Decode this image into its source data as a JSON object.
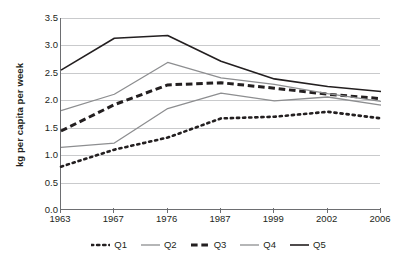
{
  "chart_data": {
    "type": "line",
    "title": "",
    "xlabel": "",
    "ylabel": "kg per capita per week",
    "categories": [
      "1963",
      "1967",
      "1976",
      "1987",
      "1999",
      "2002",
      "2006"
    ],
    "ylim": [
      0.0,
      3.5
    ],
    "ytick_step": 0.5,
    "yticks": [
      "3.5",
      "3.0",
      "2.5",
      "2.0",
      "1.5",
      "1.0",
      "0.5",
      "0.0"
    ],
    "grid": true,
    "legend_position": "bottom",
    "series": [
      {
        "name": "Q1",
        "style": "dotted",
        "color": "#231f20",
        "width": 2.6,
        "values": [
          0.79,
          1.1,
          1.32,
          1.67,
          1.7,
          1.79,
          1.67
        ]
      },
      {
        "name": "Q2",
        "style": "solid",
        "color": "#8d8e90",
        "width": 1.3,
        "values": [
          1.14,
          1.22,
          1.85,
          2.13,
          1.99,
          2.06,
          1.91
        ]
      },
      {
        "name": "Q3",
        "style": "dashed",
        "color": "#231f20",
        "width": 3.0,
        "values": [
          1.44,
          1.92,
          2.28,
          2.32,
          2.22,
          2.11,
          2.03
        ]
      },
      {
        "name": "Q4",
        "style": "solid",
        "color": "#8d8e90",
        "width": 1.3,
        "values": [
          1.81,
          2.11,
          2.69,
          2.41,
          2.29,
          2.12,
          1.98
        ]
      },
      {
        "name": "Q5",
        "style": "solid",
        "color": "#231f20",
        "width": 1.6,
        "values": [
          2.55,
          3.13,
          3.18,
          2.71,
          2.39,
          2.25,
          2.16
        ]
      }
    ]
  },
  "colors": {
    "axis": "#6d6e71",
    "grid": "#c9cacc",
    "dark_series": "#231f20",
    "gray_series": "#8d8e90",
    "background": "#ffffff"
  }
}
